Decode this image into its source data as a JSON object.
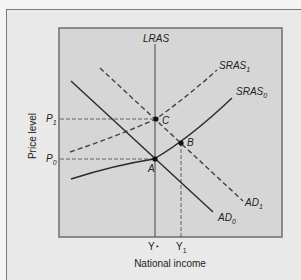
{
  "figure": {
    "type": "AD-AS diagram",
    "y_axis_label": "Price level",
    "x_axis_label": "National income",
    "curves": [
      {
        "id": "LRAS",
        "label": "LRAS",
        "sub": "",
        "style": "solid"
      },
      {
        "id": "SRAS1",
        "label": "SRAS",
        "sub": "1",
        "style": "dashed"
      },
      {
        "id": "SRAS0",
        "label": "SRAS",
        "sub": "0",
        "style": "solid"
      },
      {
        "id": "AD1",
        "label": "AD",
        "sub": "1",
        "style": "dashed"
      },
      {
        "id": "AD0",
        "label": "AD",
        "sub": "0",
        "style": "solid"
      }
    ],
    "points": [
      {
        "label": "A"
      },
      {
        "label": "B"
      },
      {
        "label": "C"
      }
    ],
    "y_ticks": [
      {
        "label": "P",
        "sub": "1"
      },
      {
        "label": "P",
        "sub": "0"
      }
    ],
    "x_ticks": [
      {
        "label": "Y",
        "sup": "*"
      },
      {
        "label": "Y",
        "sub": "1"
      }
    ],
    "colors": {
      "outer_bg": "#e9e9e9",
      "plot_bg": "#d6d6d6",
      "line": "#333333",
      "border": "#6e6e6e"
    }
  }
}
